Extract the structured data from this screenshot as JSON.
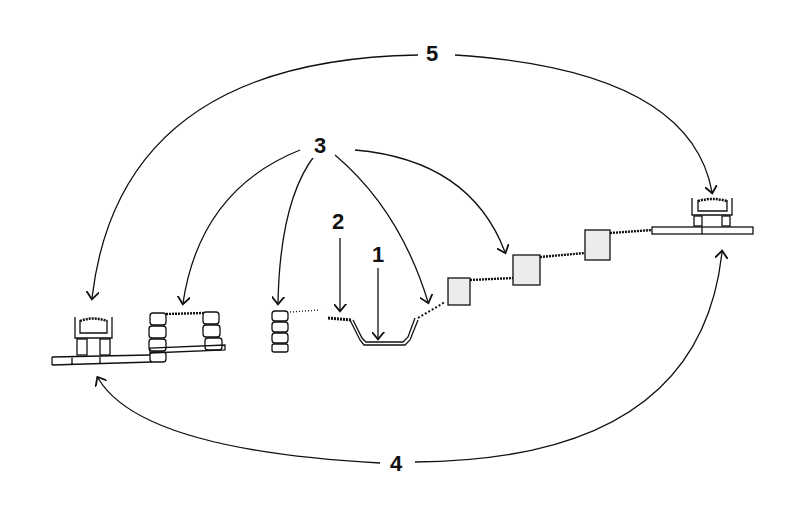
{
  "diagram": {
    "labels": {
      "l1": "1",
      "l2": "2",
      "l3": "3",
      "l4": "4",
      "l5": "5"
    },
    "colors": {
      "ink": "#111111",
      "fill": "#e6e6e6"
    }
  }
}
